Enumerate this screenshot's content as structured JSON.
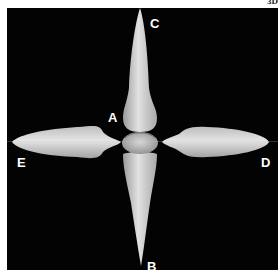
{
  "figure": {
    "corner_text": "3D",
    "panel_background": "#030303",
    "tooth_color": "#d6d6d6",
    "labels": {
      "a": "A",
      "b": "B",
      "c": "C",
      "d": "D",
      "e": "E"
    },
    "views": [
      {
        "label": "A",
        "description": "center occlusal view"
      },
      {
        "label": "B",
        "description": "bottom vertical view"
      },
      {
        "label": "C",
        "description": "top vertical view"
      },
      {
        "label": "D",
        "description": "right horizontal view"
      },
      {
        "label": "E",
        "description": "left horizontal view"
      }
    ]
  }
}
